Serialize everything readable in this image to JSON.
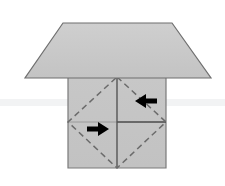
{
  "diagram": {
    "title": "Origami fold step diagram",
    "kind": "origami-fold-step",
    "background_color": "#ffffff",
    "band": {
      "label": "faint horizontal guide band",
      "color": "#f2f3f4",
      "y": 99,
      "height": 7
    },
    "shapes": {
      "top_flap": {
        "label": "Top trapezoid flap",
        "fill_color": "#c9c9c9",
        "stroke_color": "#6f6f6f",
        "points": "63,23 172,23 211,78 25,78"
      },
      "base_square": {
        "label": "Base square panel",
        "fill_color": "#c6c6c6",
        "stroke_color": "#7a7a7a",
        "points": "68,77 166,77 166,168 68,168"
      },
      "crease_diamond": {
        "label": "Inscribed dashed crease diamond",
        "stroke_color": "#6b6b6b",
        "dash": "6 4",
        "points": "117,77 166,122 117,168 68,122"
      },
      "vertical_crease": {
        "label": "Vertical centre crease",
        "stroke_color": "#555555",
        "x": 117,
        "y1": 77,
        "y2": 168
      },
      "horizontal_crease_right": {
        "label": "Right horizontal crease",
        "stroke_color": "#4a4a4a",
        "x1": 117,
        "x2": 166,
        "y": 122
      },
      "horizontal_crease_left": {
        "label": "Left horizontal crease",
        "stroke_color": "#9a9a9a",
        "x1": 68,
        "x2": 117,
        "y": 122
      }
    },
    "arrows": [
      {
        "name": "arrow-left",
        "label": "Left-pointing fold arrow",
        "direction": "left",
        "color": "#000000",
        "x": 146,
        "y": 101
      },
      {
        "name": "arrow-right",
        "label": "Right-pointing fold arrow",
        "direction": "right",
        "color": "#000000",
        "x": 98,
        "y": 129
      }
    ]
  }
}
